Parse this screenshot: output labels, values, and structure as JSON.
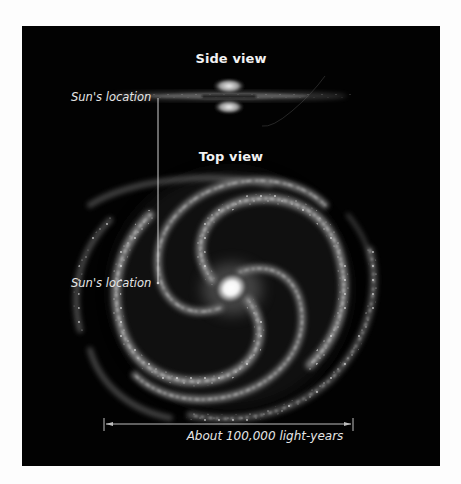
{
  "figure": {
    "background_color": "#020202",
    "page_color": "#fdfdfd",
    "side_view": {
      "title": "Side view",
      "sun_label": "Sun's location"
    },
    "top_view": {
      "title": "Top view",
      "sun_label": "Sun's location"
    },
    "scale_bar": {
      "label": "About 100,000 light-years"
    }
  }
}
